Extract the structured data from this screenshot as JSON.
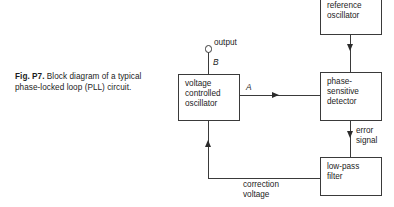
{
  "figure": {
    "caption_number": "Fig. P7.",
    "caption_text": " Block diagram of a typical phase-locked loop (PLL) circuit."
  },
  "blocks": {
    "vco": {
      "line1": "voltage",
      "line2": "controlled",
      "line3": "oscillator"
    },
    "phase_sensitive_detector": {
      "line1": "phase-",
      "line2": "sensitive",
      "line3": "detector"
    },
    "master_reference_oscillator": {
      "line1": "master",
      "line2": "reference",
      "line3": "oscillator"
    },
    "low_pass_filter": {
      "line1": "low-pass",
      "line2": "filter"
    }
  },
  "labels": {
    "output": "output",
    "node_b": "B",
    "node_a": "A",
    "error_signal_line1": "error",
    "error_signal_line2": "signal",
    "correction_line1": "correction",
    "correction_line2": "voltage"
  },
  "colors": {
    "background": "#ffffff",
    "line": "#3a3a3a",
    "text": "#1c1c1c"
  }
}
